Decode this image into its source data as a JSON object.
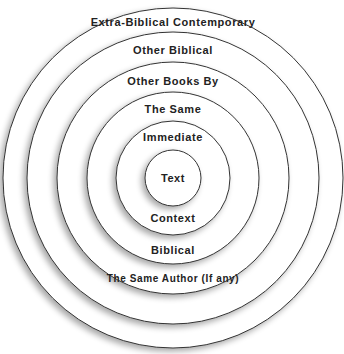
{
  "diagram": {
    "type": "concentric-circles",
    "colors": {
      "stroke": "#333333",
      "fill": "#ffffff",
      "text": "#222222",
      "shadow": "#9a9a9a"
    },
    "center": {
      "x": 173,
      "y": 178
    },
    "rings": [
      {
        "id": "extra-biblical",
        "radius": 171,
        "label": "Extra-Biblical Contemporary"
      },
      {
        "id": "other-biblical",
        "radius": 146,
        "label": "Other Biblical"
      },
      {
        "id": "other-books",
        "radius": 116,
        "label_top": "Other Books By",
        "label_bottom": "The Same Author (If any)"
      },
      {
        "id": "the-same",
        "radius": 86,
        "label_top": "The Same",
        "label_bottom": "Biblical"
      },
      {
        "id": "immediate",
        "radius": 56,
        "label_top": "Immediate",
        "label_bottom": "Context"
      },
      {
        "id": "text",
        "radius": 28,
        "label": "Text"
      }
    ]
  }
}
